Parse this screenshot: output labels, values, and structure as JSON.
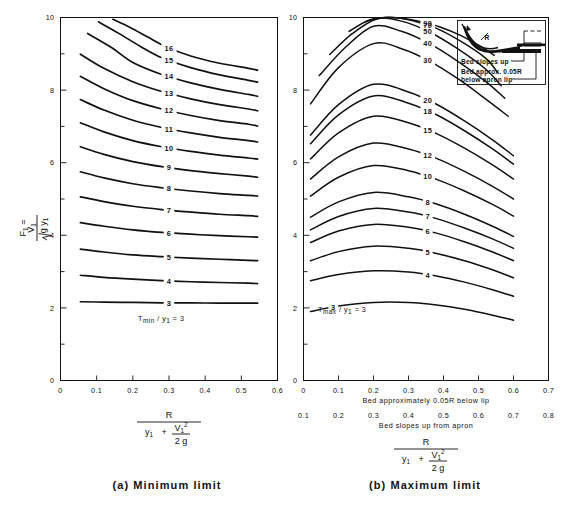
{
  "figure": {
    "panels": [
      {
        "id": "a",
        "caption": "(a)  Minimum limit",
        "ylabel_main": "F",
        "ylabel_sub": "1",
        "ylabel_eq": "=",
        "ylabel_num": "V",
        "ylabel_num_sub": "1",
        "ylabel_den": "g y",
        "ylabel_den_sub": "1",
        "xlabel_num": "R",
        "xlabel_den_a": "y",
        "xlabel_den_a_sub": "1",
        "xlabel_den_plus": "+",
        "xlabel_den_b": "V",
        "xlabel_den_b_sub": "1",
        "xlabel_den_b_sup": "2",
        "xlabel_den_c": "2 g",
        "family_label": "T",
        "family_label_sub": "min",
        "family_label_div": "/ y",
        "family_label_div_sub": "1",
        "family_label_eq": "= 3"
      },
      {
        "id": "b",
        "caption": "(b)  Maximum limit",
        "family_label": "T",
        "family_label_sub": "max",
        "family_label_div": "/ y",
        "family_label_div_sub": "1",
        "family_label_eq": "= 3",
        "axis_caption_upper": "Bed  approximately  0.05R  below  lip",
        "axis_caption_lower": "Bed  slopes  up  from  apron",
        "inset_line1": "Bed  slopes  up",
        "inset_line2": "Bed  approx.  0.05R",
        "inset_line3": "below  apron  lip",
        "inset_radius_label": "R"
      }
    ]
  },
  "chart_data": [
    {
      "type": "line",
      "title": "(a)  Minimum limit",
      "xlabel": "R / (y1 + V1^2 / 2g)",
      "ylabel": "F1 = V1 / sqrt(g y1)",
      "xlim": [
        0,
        0.6
      ],
      "ylim": [
        0,
        10
      ],
      "xticks": [
        "0",
        "0.1",
        "0.2",
        "0.3",
        "0.4",
        "0.5",
        "0.6"
      ],
      "yticks": [
        "0",
        "2",
        "4",
        "6",
        "8",
        "10"
      ],
      "grid": false,
      "legend": "inline-curve-labels",
      "series_label_prefix": "Tmin/y1",
      "series": [
        {
          "name": "3",
          "label_x": 0.3,
          "x": [
            0.055,
            0.12,
            0.2,
            0.28,
            0.36,
            0.44,
            0.52,
            0.545
          ],
          "y": [
            2.17,
            2.16,
            2.15,
            2.14,
            2.14,
            2.13,
            2.13,
            2.13
          ]
        },
        {
          "name": "4",
          "label_x": 0.3,
          "x": [
            0.055,
            0.12,
            0.2,
            0.28,
            0.36,
            0.44,
            0.52,
            0.545
          ],
          "y": [
            2.9,
            2.84,
            2.79,
            2.75,
            2.72,
            2.7,
            2.68,
            2.67
          ]
        },
        {
          "name": "5",
          "label_x": 0.3,
          "x": [
            0.055,
            0.12,
            0.2,
            0.28,
            0.36,
            0.44,
            0.52,
            0.545
          ],
          "y": [
            3.62,
            3.54,
            3.46,
            3.41,
            3.37,
            3.34,
            3.31,
            3.3
          ]
        },
        {
          "name": "6",
          "label_x": 0.3,
          "x": [
            0.055,
            0.12,
            0.2,
            0.28,
            0.36,
            0.44,
            0.52,
            0.545
          ],
          "y": [
            4.35,
            4.25,
            4.15,
            4.08,
            4.03,
            3.99,
            3.96,
            3.95
          ]
        },
        {
          "name": "7",
          "label_x": 0.3,
          "x": [
            0.055,
            0.12,
            0.2,
            0.28,
            0.36,
            0.44,
            0.52,
            0.545
          ],
          "y": [
            5.06,
            4.93,
            4.8,
            4.71,
            4.64,
            4.58,
            4.54,
            4.52
          ]
        },
        {
          "name": "8",
          "label_x": 0.3,
          "x": [
            0.055,
            0.12,
            0.2,
            0.28,
            0.36,
            0.44,
            0.52,
            0.545
          ],
          "y": [
            5.75,
            5.58,
            5.42,
            5.31,
            5.22,
            5.15,
            5.1,
            5.08
          ]
        },
        {
          "name": "9",
          "label_x": 0.3,
          "x": [
            0.055,
            0.12,
            0.2,
            0.28,
            0.36,
            0.44,
            0.52,
            0.545
          ],
          "y": [
            6.44,
            6.23,
            6.03,
            5.89,
            5.78,
            5.7,
            5.63,
            5.6
          ]
        },
        {
          "name": "10",
          "label_x": 0.3,
          "x": [
            0.055,
            0.12,
            0.2,
            0.28,
            0.36,
            0.44,
            0.52,
            0.545
          ],
          "y": [
            7.1,
            6.85,
            6.61,
            6.44,
            6.31,
            6.21,
            6.13,
            6.1
          ]
        },
        {
          "name": "11",
          "label_x": 0.3,
          "x": [
            0.055,
            0.12,
            0.2,
            0.28,
            0.36,
            0.44,
            0.52,
            0.545
          ],
          "y": [
            7.74,
            7.45,
            7.17,
            6.97,
            6.82,
            6.7,
            6.61,
            6.57
          ]
        },
        {
          "name": "12",
          "label_x": 0.3,
          "x": [
            0.055,
            0.12,
            0.2,
            0.28,
            0.36,
            0.44,
            0.52,
            0.545
          ],
          "y": [
            8.38,
            8.04,
            7.71,
            7.48,
            7.3,
            7.16,
            7.06,
            7.01
          ]
        },
        {
          "name": "13",
          "label_x": 0.3,
          "x": [
            0.055,
            0.12,
            0.2,
            0.28,
            0.36,
            0.44,
            0.52,
            0.545
          ],
          "y": [
            8.99,
            8.6,
            8.23,
            7.96,
            7.76,
            7.6,
            7.48,
            7.43
          ]
        },
        {
          "name": "14",
          "label_x": 0.3,
          "x": [
            0.075,
            0.14,
            0.2,
            0.28,
            0.36,
            0.44,
            0.52,
            0.545
          ],
          "y": [
            9.56,
            9.18,
            8.76,
            8.43,
            8.2,
            8.02,
            7.88,
            7.83
          ]
        },
        {
          "name": "15",
          "label_x": 0.3,
          "x": [
            0.105,
            0.16,
            0.22,
            0.28,
            0.36,
            0.44,
            0.52,
            0.545
          ],
          "y": [
            9.88,
            9.57,
            9.21,
            8.89,
            8.62,
            8.42,
            8.27,
            8.22
          ]
        },
        {
          "name": "16",
          "label_x": 0.3,
          "x": [
            0.145,
            0.19,
            0.24,
            0.29,
            0.36,
            0.44,
            0.52,
            0.545
          ],
          "y": [
            9.95,
            9.74,
            9.47,
            9.2,
            8.94,
            8.74,
            8.6,
            8.55
          ]
        }
      ]
    },
    {
      "type": "line",
      "title": "(b)  Maximum limit",
      "xlabel": "R / (y1 + V1^2 / 2g)",
      "ylabel": "F1 = V1 / sqrt(g y1)",
      "xlim": [
        0,
        0.7
      ],
      "ylim": [
        0,
        10
      ],
      "xticks_upper": [
        "0",
        "0.1",
        "0.2",
        "0.3",
        "0.4",
        "0.5",
        "0.6",
        "0.7"
      ],
      "xticks_lower": [
        "0.1",
        "0.2",
        "0.3",
        "0.4",
        "0.5",
        "0.6",
        "0.7",
        "0.8"
      ],
      "yticks": [
        "0",
        "2",
        "4",
        "6",
        "8",
        "10"
      ],
      "grid": false,
      "legend": "inline-curve-labels",
      "series_label_prefix": "Tmax/y1",
      "series": [
        {
          "name": "3",
          "label_x": 0.085,
          "x": [
            0.02,
            0.1,
            0.2,
            0.3,
            0.38,
            0.46,
            0.54,
            0.6
          ],
          "y": [
            1.9,
            2.05,
            2.15,
            2.15,
            2.08,
            1.96,
            1.8,
            1.66
          ]
        },
        {
          "name": "4",
          "label_x": 0.355,
          "x": [
            0.02,
            0.1,
            0.2,
            0.3,
            0.38,
            0.46,
            0.54,
            0.6
          ],
          "y": [
            2.75,
            2.92,
            3.02,
            2.99,
            2.88,
            2.71,
            2.5,
            2.32
          ]
        },
        {
          "name": "5",
          "label_x": 0.355,
          "x": [
            0.02,
            0.1,
            0.2,
            0.3,
            0.38,
            0.46,
            0.54,
            0.6
          ],
          "y": [
            3.3,
            3.55,
            3.7,
            3.64,
            3.5,
            3.3,
            3.05,
            2.83
          ]
        },
        {
          "name": "6",
          "label_x": 0.355,
          "x": [
            0.02,
            0.1,
            0.2,
            0.3,
            0.38,
            0.46,
            0.54,
            0.6
          ],
          "y": [
            3.8,
            4.12,
            4.3,
            4.22,
            4.06,
            3.82,
            3.54,
            3.3
          ]
        },
        {
          "name": "7",
          "label_x": 0.355,
          "x": [
            0.02,
            0.1,
            0.2,
            0.3,
            0.38,
            0.46,
            0.54,
            0.6
          ],
          "y": [
            4.15,
            4.52,
            4.74,
            4.64,
            4.46,
            4.2,
            3.9,
            3.64
          ]
        },
        {
          "name": "8",
          "label_x": 0.355,
          "x": [
            0.02,
            0.1,
            0.2,
            0.3,
            0.38,
            0.46,
            0.54,
            0.6
          ],
          "y": [
            4.5,
            4.92,
            5.18,
            5.06,
            4.86,
            4.58,
            4.25,
            3.97
          ]
        },
        {
          "name": "10",
          "label_x": 0.355,
          "x": [
            0.02,
            0.1,
            0.2,
            0.3,
            0.38,
            0.46,
            0.54,
            0.6
          ],
          "y": [
            5.08,
            5.6,
            5.92,
            5.78,
            5.54,
            5.22,
            4.85,
            4.53
          ]
        },
        {
          "name": "12",
          "label_x": 0.355,
          "x": [
            0.02,
            0.1,
            0.2,
            0.3,
            0.38,
            0.46,
            0.54,
            0.6
          ],
          "y": [
            5.55,
            6.16,
            6.54,
            6.38,
            6.12,
            5.76,
            5.35,
            5.0
          ]
        },
        {
          "name": "15",
          "label_x": 0.355,
          "x": [
            0.02,
            0.1,
            0.2,
            0.3,
            0.38,
            0.46,
            0.54,
            0.6
          ],
          "y": [
            6.1,
            6.82,
            7.28,
            7.1,
            6.8,
            6.4,
            5.94,
            5.55
          ]
        },
        {
          "name": "18",
          "label_x": 0.355,
          "x": [
            0.02,
            0.1,
            0.2,
            0.3,
            0.38,
            0.46,
            0.54,
            0.6
          ],
          "y": [
            6.52,
            7.32,
            7.84,
            7.64,
            7.32,
            6.88,
            6.38,
            5.96
          ]
        },
        {
          "name": "20",
          "label_x": 0.355,
          "x": [
            0.02,
            0.1,
            0.2,
            0.3,
            0.38,
            0.46,
            0.54,
            0.6
          ],
          "y": [
            6.76,
            7.6,
            8.16,
            7.95,
            7.61,
            7.15,
            6.63,
            6.19
          ]
        },
        {
          "name": "30",
          "label_x": 0.355,
          "x": [
            0.02,
            0.1,
            0.2,
            0.28,
            0.36,
            0.44,
            0.52,
            0.585
          ],
          "y": [
            7.62,
            8.62,
            9.28,
            9.14,
            8.8,
            8.32,
            7.76,
            7.28
          ]
        },
        {
          "name": "40",
          "label_x": 0.355,
          "x": [
            0.045,
            0.12,
            0.2,
            0.28,
            0.36,
            0.44,
            0.52,
            0.575
          ],
          "y": [
            8.4,
            9.18,
            9.76,
            9.62,
            9.28,
            8.8,
            8.24,
            7.78
          ]
        },
        {
          "name": "50",
          "label_x": 0.355,
          "x": [
            0.075,
            0.14,
            0.21,
            0.28,
            0.36,
            0.44,
            0.52,
            0.565
          ],
          "y": [
            8.98,
            9.56,
            9.96,
            9.9,
            9.6,
            9.14,
            8.58,
            8.12
          ]
        },
        {
          "name": "70",
          "label_x": 0.355,
          "x": [
            0.13,
            0.19,
            0.25,
            0.31,
            0.38,
            0.45,
            0.52,
            0.555
          ],
          "y": [
            9.62,
            9.94,
            10.0,
            9.92,
            9.7,
            9.34,
            8.88,
            8.48
          ]
        },
        {
          "name": "90",
          "label_x": 0.355,
          "x": [
            0.175,
            0.23,
            0.28,
            0.33,
            0.39,
            0.45,
            0.51,
            0.545
          ],
          "y": [
            9.88,
            10.0,
            9.98,
            9.9,
            9.74,
            9.5,
            9.18,
            8.96
          ]
        }
      ]
    }
  ]
}
